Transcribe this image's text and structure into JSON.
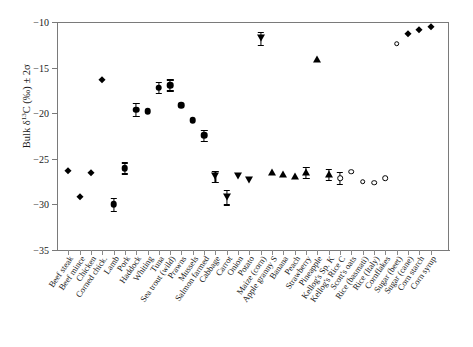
{
  "chart_data": {
    "type": "scatter",
    "title": "",
    "xlabel": "",
    "ylabel": "Bulk δ13C (‰) ± 2σ",
    "ylim": [
      -35,
      -10
    ],
    "yticks": [
      -10,
      -15,
      -20,
      -25,
      -30,
      -35
    ],
    "ytick_labels": [
      "−10",
      "−15",
      "−20",
      "−25",
      "−30",
      "−35"
    ],
    "grid": false,
    "legend": "none",
    "categories": [
      "Beef steak",
      "Beef mince",
      "Chicken",
      "Corned chick.",
      "Lamb",
      "Pork",
      "Haddock",
      "Whiting",
      "Tuna",
      "Sea trout (wild)",
      "Prawns",
      "Mussels",
      "Salmon farmed",
      "Cabbage",
      "Carrot",
      "Onion",
      "Potato",
      "Maize (corn)",
      "Apple granny S",
      "Banana",
      "Peach",
      "Strawberry",
      "Pineapple",
      "Kellog's Sp. K",
      "Kellog's Rice C",
      "Scott's oats",
      "Rice (basmati)",
      "Rice (Italy)",
      "Cornflakes",
      "Sugar (beet)",
      "Sugar (cane)",
      "Corn starch",
      "Corn syrup"
    ],
    "values": [
      -26.3,
      -29.2,
      -26.6,
      -16.4,
      -30.0,
      -26.0,
      -19.6,
      -19.8,
      -17.2,
      -16.9,
      -19.1,
      -20.8,
      -22.4,
      -26.9,
      -29.2,
      -26.9,
      -27.3,
      -11.8,
      -26.4,
      -26.7,
      -26.9,
      -26.5,
      -14.1,
      -26.7,
      -27.1,
      -26.4,
      -27.5,
      -27.6,
      -27.1,
      -12.4,
      -11.3,
      -10.9,
      -10.6
    ],
    "errors": [
      0.0,
      0.0,
      0.0,
      0.0,
      0.7,
      0.6,
      0.7,
      0.0,
      0.6,
      0.6,
      0.0,
      0.0,
      0.6,
      0.6,
      0.8,
      0.0,
      0.0,
      0.7,
      0.0,
      0.0,
      0.0,
      0.6,
      0.0,
      0.6,
      0.7,
      0.0,
      0.0,
      0.0,
      0.0,
      0.0,
      0.0,
      0.0,
      0.0
    ],
    "markers": [
      "diamond",
      "diamond",
      "diamond",
      "diamond",
      "circle-filled",
      "circle-filled",
      "circle-filled",
      "circle-filled",
      "circle-filled",
      "circle-filled",
      "circle-filled",
      "circle-filled",
      "circle-filled",
      "triangle-down",
      "triangle-down",
      "triangle-down",
      "triangle-down",
      "triangle-down",
      "triangle-up",
      "triangle-up",
      "triangle-up",
      "triangle-up",
      "triangle-up",
      "triangle-up",
      "circle-open",
      "circle-open",
      "circle-open",
      "circle-open",
      "circle-open",
      "circle-open",
      "diamond",
      "diamond",
      "diamond"
    ],
    "marker_color": "#000000",
    "groups": [
      {
        "name": "Meat",
        "marker": "diamond"
      },
      {
        "name": "Fish & seafood",
        "marker": "circle-filled"
      },
      {
        "name": "Vegetables",
        "marker": "triangle-down"
      },
      {
        "name": "Fruit",
        "marker": "triangle-up"
      },
      {
        "name": "Cereals",
        "marker": "circle-open"
      },
      {
        "name": "Sugars & starches",
        "marker": "diamond"
      }
    ]
  }
}
